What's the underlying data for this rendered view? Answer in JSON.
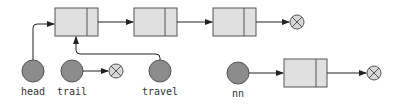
{
  "diagram": {
    "type": "linked-list",
    "colors": {
      "node_fill": "#e0e0e0",
      "node_stroke": "#555555",
      "pointer_fill": "#8c8c8c",
      "pointer_stroke": "#555555",
      "null_fill": "#d8d8d8",
      "arrow": "#222222"
    },
    "main_list": {
      "nodes": [
        {
          "id": "node1"
        },
        {
          "id": "node2"
        },
        {
          "id": "node3"
        }
      ],
      "terminator": "null"
    },
    "pointers": [
      {
        "id": "head",
        "label": "head",
        "points_to": "node1"
      },
      {
        "id": "trail",
        "label": "trail",
        "points_to": "null"
      },
      {
        "id": "travel",
        "label": "travel",
        "points_to": "node1"
      },
      {
        "id": "nn",
        "label": "nn",
        "points_to": "new_node"
      }
    ],
    "new_node": {
      "id": "node4",
      "next": "null"
    }
  }
}
